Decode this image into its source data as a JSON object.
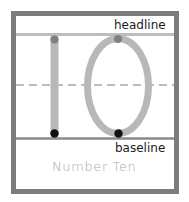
{
  "worksheet": {
    "headline_label": "headline",
    "baseline_label": "baseline",
    "caption": "Number Ten",
    "digits": [
      "1",
      "0"
    ],
    "colors": {
      "frame": "#7d7d7d",
      "guide_lines": "#bdbdbd",
      "stroke": "#b8b8b8",
      "start_dot": "#808080",
      "end_dot": "#111111",
      "caption": "#a8a8a8"
    }
  }
}
